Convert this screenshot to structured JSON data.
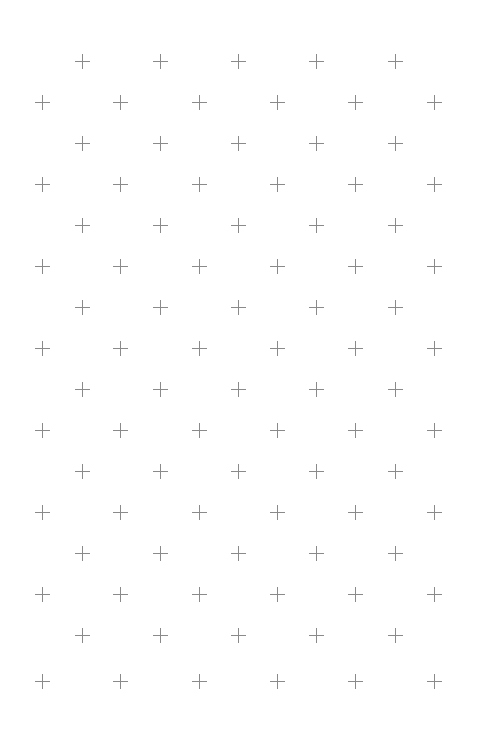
{
  "pattern": {
    "icon": "plus-icon",
    "color": "#8a8a8a",
    "background": "#ffffff",
    "odd_rows": {
      "y": [
        61,
        143,
        225,
        307,
        389,
        471,
        553,
        635
      ],
      "x": [
        82,
        160,
        238,
        316,
        395
      ]
    },
    "even_rows": {
      "y": [
        102,
        184,
        266,
        348,
        430,
        512,
        594,
        681
      ],
      "x": [
        42,
        120,
        199,
        277,
        355,
        434
      ]
    }
  }
}
